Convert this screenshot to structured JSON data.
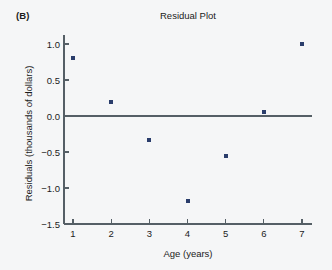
{
  "panel": {
    "label": "(B)"
  },
  "chart_data": {
    "type": "scatter",
    "title": "Residual Plot",
    "xlabel": "Age (years)",
    "ylabel": "Residuals (thousands of dollars)",
    "x": [
      1,
      2,
      3,
      4,
      5,
      6,
      7
    ],
    "values": [
      0.8,
      0.2,
      -0.33,
      -1.18,
      -0.55,
      0.06,
      1.0
    ],
    "series": [
      {
        "name": "Residuals",
        "points": [
          {
            "x": 1,
            "y": 0.8
          },
          {
            "x": 2,
            "y": 0.2
          },
          {
            "x": 3,
            "y": -0.33
          },
          {
            "x": 4,
            "y": -1.18
          },
          {
            "x": 5,
            "y": -0.55
          },
          {
            "x": 6,
            "y": 0.06
          },
          {
            "x": 7,
            "y": 1.0
          }
        ]
      }
    ],
    "xlim": [
      0.6,
      7.5
    ],
    "ylim": [
      -1.5,
      1.15
    ],
    "xticks": [
      1,
      2,
      3,
      4,
      5,
      6,
      7
    ],
    "xtick_labels": [
      "1",
      "2",
      "3",
      "4",
      "5",
      "6",
      "7"
    ],
    "yticks": [
      1.0,
      0.5,
      0.0,
      -0.5,
      -1.0,
      -1.5
    ],
    "ytick_labels": [
      "1.0",
      "0.5",
      "0.0",
      "−0.5",
      "−1.0",
      "−1.5"
    ],
    "grid": false,
    "legend": null,
    "reference_line": {
      "y": 0.0,
      "orientation": "horizontal"
    },
    "marker": {
      "shape": "square",
      "color": "#2a3d6b",
      "size": 4
    },
    "axis_color": "#555f66",
    "background": "#f5f6f7"
  }
}
